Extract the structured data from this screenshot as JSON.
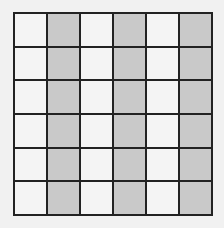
{
  "diagram": {
    "type": "grid",
    "rows": 6,
    "columns": 6,
    "shaded_columns": [
      2,
      4,
      6
    ],
    "colors": {
      "line": "#222222",
      "unshaded": "#f4f4f4",
      "shaded": "#c9c9c9",
      "background": "#f1f1f1"
    }
  }
}
